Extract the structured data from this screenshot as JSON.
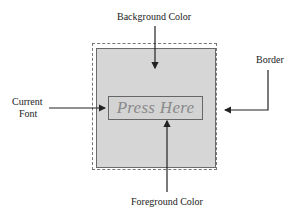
{
  "diagram": {
    "labels": {
      "background_color": "Background Color",
      "border": "Border",
      "current_font_line1": "Current",
      "current_font_line2": "Font",
      "foreground_color": "Foreground Color"
    },
    "button": {
      "text": "Press Here"
    },
    "colors": {
      "background": "#d6d6d6",
      "foreground_text": "#8a8a8a",
      "border": "#6a6a6a",
      "arrow": "#222222"
    }
  }
}
